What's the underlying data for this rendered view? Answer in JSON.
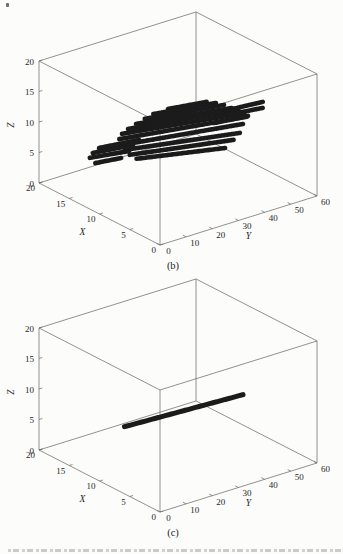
{
  "figure": {
    "background": "#fcfcfb",
    "axis_line_color": "#6e6e6e",
    "text_color": "#1f1f1f"
  },
  "chart_data": [
    {
      "type": "scatter",
      "subtype": "scatter3d-point-rows",
      "caption": "(b)",
      "axes": {
        "x": {
          "label": "X",
          "range": [
            0,
            20
          ],
          "ticks": [
            0,
            5,
            10,
            15,
            20
          ]
        },
        "y": {
          "label": "Y",
          "range": [
            0,
            60
          ],
          "ticks": [
            0,
            10,
            20,
            30,
            40,
            50,
            60
          ]
        },
        "z": {
          "label": "Z",
          "range": [
            0,
            20
          ],
          "ticks": [
            0,
            5,
            10,
            15,
            20
          ]
        }
      },
      "grid": false,
      "box": true,
      "marker_color": "#1b1b1b",
      "marker_size": 4.6,
      "dash": [
        2.4,
        1.0
      ],
      "segments": [
        {
          "x0": 17.6,
          "y0": 43.7,
          "x1": 16.6,
          "y1": 56.2,
          "z": 7.5
        },
        {
          "x0": 17.5,
          "y0": 37.9,
          "x1": 15.8,
          "y1": 57.9,
          "z": 7.5
        },
        {
          "x0": 17.1,
          "y0": 33.4,
          "x1": 14.9,
          "y1": 58.9,
          "z": 7.5
        },
        {
          "x0": 16.6,
          "y0": 29.2,
          "x1": 13.8,
          "y1": 59.4,
          "z": 7.5
        },
        {
          "x0": 16.1,
          "y0": 25.0,
          "x1": 13.0,
          "y1": 60.0,
          "z": 7.5
        },
        {
          "x0": 15.5,
          "y0": 21.2,
          "x1": 12.0,
          "y1": 60.0,
          "z": 7.5
        },
        {
          "x0": 14.6,
          "y0": 18.2,
          "x1": 11.1,
          "y1": 58.8,
          "z": 7.5
        },
        {
          "x0": 13.3,
          "y0": 15.9,
          "x1": 9.9,
          "y1": 54.6,
          "z": 7.5
        },
        {
          "x0": 12.1,
          "y0": 14.5,
          "x1": 8.3,
          "y1": 49.7,
          "z": 7.5
        },
        {
          "x0": 10.8,
          "y0": 13.4,
          "x1": 7.3,
          "y1": 45.0,
          "z": 7.5
        },
        {
          "x0": 9.6,
          "y0": 13.0,
          "x1": 6.2,
          "y1": 39.2,
          "z": 7.5
        },
        {
          "x0": 14.1,
          "y0": 9.3,
          "x1": 13.2,
          "y1": 22.5,
          "z": 7.5
        },
        {
          "x0": 13.5,
          "y0": 5.5,
          "x1": 12.5,
          "y1": 19.0,
          "z": 7.5
        },
        {
          "x0": 12.7,
          "y0": 2.5,
          "x1": 11.6,
          "y1": 15.0,
          "z": 7.5
        },
        {
          "x0": 11.3,
          "y0": 1.4,
          "x1": 10.7,
          "y1": 9.9,
          "z": 7.5
        },
        {
          "x0": 8.8,
          "y0": 44.8,
          "x1": 8.2,
          "y1": 58.2,
          "z": 11.5
        },
        {
          "x0": 8.0,
          "y0": 40.6,
          "x1": 7.0,
          "y1": 55.4,
          "z": 11.5
        },
        {
          "x0": 7.0,
          "y0": 36.9,
          "x1": 6.3,
          "y1": 48.2,
          "z": 11.5
        }
      ]
    },
    {
      "type": "scatter",
      "subtype": "scatter3d-point-rows",
      "caption": "(c)",
      "axes": {
        "x": {
          "label": "X",
          "range": [
            0,
            20
          ],
          "ticks": [
            0,
            5,
            10,
            15,
            20
          ]
        },
        "y": {
          "label": "Y",
          "range": [
            0,
            60
          ],
          "ticks": [
            0,
            10,
            20,
            30,
            40,
            50,
            60
          ]
        },
        "z": {
          "label": "Z",
          "range": [
            0,
            20
          ],
          "ticks": [
            0,
            5,
            10,
            15,
            20
          ]
        }
      },
      "grid": false,
      "box": true,
      "marker_color": "#1b1b1b",
      "marker_size": 5.0,
      "dash": [
        2.7,
        0.9
      ],
      "segments": [
        {
          "x0": 11.5,
          "y0": 13.0,
          "x1": 10.5,
          "y1": 56.0,
          "z": 6.4
        }
      ]
    }
  ]
}
